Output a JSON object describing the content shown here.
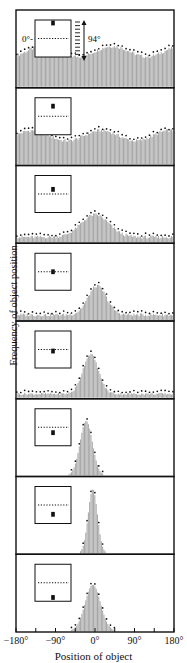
{
  "chart_data": {
    "type": "bar",
    "subtype": "stacked-histogram-panels",
    "title": "",
    "xlabel": "Position of object",
    "ylabel": "Frequency of object position",
    "xlim": [
      -180,
      180
    ],
    "x_ticks": [
      -180,
      -135,
      -90,
      -45,
      0,
      45,
      90,
      135,
      180
    ],
    "x_tick_labels": [
      "−180°",
      "−90°",
      "0°",
      "90°",
      "180°"
    ],
    "x_tick_label_positions": [
      -180,
      -90,
      0,
      90,
      180
    ],
    "annotations": {
      "inset_zero_label": "0°",
      "inset_range_label": "94°"
    },
    "legend": "Each panel inset shows the object (filled square) position relative to the horizon (dotted line); bars = observed frequency, dotted envelope = distribution outline",
    "panels": [
      {
        "name": "object-top",
        "object_offset": 1.0,
        "shape": "flat",
        "level": 0.55,
        "peak_center": 0,
        "peak_height": 0.6,
        "width": 180
      },
      {
        "name": "object-high",
        "object_offset": 0.65,
        "shape": "flat",
        "level": 0.45,
        "peak_center": 0,
        "peak_height": 0.5,
        "width": 180
      },
      {
        "name": "object-slightly-above",
        "object_offset": 0.3,
        "shape": "peak",
        "level": 0.08,
        "peak_center": 0,
        "peak_height": 0.35,
        "width": 45
      },
      {
        "name": "object-at-horizon",
        "object_offset": 0.0,
        "shape": "peak",
        "level": 0.08,
        "peak_center": 5,
        "peak_height": 0.45,
        "width": 30
      },
      {
        "name": "object-slightly-below",
        "object_offset": -0.1,
        "shape": "peak",
        "level": 0.06,
        "peak_center": -10,
        "peak_height": 0.62,
        "width": 25
      },
      {
        "name": "object-below",
        "object_offset": -0.35,
        "shape": "peak",
        "level": 0.0,
        "peak_center": -20,
        "peak_height": 0.85,
        "width": 20
      },
      {
        "name": "object-low",
        "object_offset": -0.6,
        "shape": "peak",
        "level": 0.0,
        "peak_center": -5,
        "peak_height": 1.0,
        "width": 15
      },
      {
        "name": "object-bottom",
        "object_offset": -0.95,
        "shape": "peak",
        "level": 0.0,
        "peak_center": -5,
        "peak_height": 0.72,
        "width": 25
      }
    ]
  }
}
